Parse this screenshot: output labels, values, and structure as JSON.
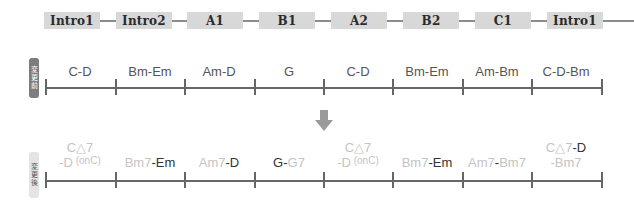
{
  "sections": [
    {
      "label": "Intro1",
      "x": 44
    },
    {
      "label": "Intro2",
      "x": 116
    },
    {
      "label": "A1",
      "x": 187
    },
    {
      "label": "B1",
      "x": 259
    },
    {
      "label": "A2",
      "x": 331
    },
    {
      "label": "B2",
      "x": 403
    },
    {
      "label": "C1",
      "x": 475
    },
    {
      "label": "Intro1",
      "x": 547
    }
  ],
  "before": {
    "label_chars": [
      "変",
      "更",
      "前"
    ],
    "chords": [
      "C-D",
      "Bm-Em",
      "Am-D",
      "G",
      "C-D",
      "Bm-Em",
      "Am-Bm",
      "C-D-Bm"
    ]
  },
  "after": {
    "label_chars": [
      "変",
      "更",
      "後"
    ],
    "chords": [
      {
        "line1": [
          {
            "t": "C△7",
            "c": "lt"
          }
        ],
        "line2": [
          {
            "t": "-D",
            "c": "lt"
          },
          {
            "t": " (onC)",
            "c": "lt",
            "sup": true
          }
        ]
      },
      {
        "line1": [
          {
            "t": "Bm7",
            "c": "lt"
          },
          {
            "t": "-Em",
            "c": "dk"
          }
        ]
      },
      {
        "line1": [
          {
            "t": "Am7",
            "c": "lt"
          },
          {
            "t": "-D",
            "c": "dk"
          }
        ]
      },
      {
        "line1": [
          {
            "t": "G",
            "c": "dk"
          },
          {
            "t": "-",
            "c": "dk"
          },
          {
            "t": "G7",
            "c": "lt"
          }
        ]
      },
      {
        "line1": [
          {
            "t": "C△7",
            "c": "lt"
          }
        ],
        "line2": [
          {
            "t": "-D",
            "c": "lt"
          },
          {
            "t": " (onC)",
            "c": "lt",
            "sup": true
          }
        ]
      },
      {
        "line1": [
          {
            "t": "Bm7",
            "c": "lt"
          },
          {
            "t": "-Em",
            "c": "dk"
          }
        ]
      },
      {
        "line1": [
          {
            "t": "Am7",
            "c": "lt"
          },
          {
            "t": "-",
            "c": "dk"
          },
          {
            "t": "Bm7",
            "c": "lt"
          }
        ]
      },
      {
        "line1": [
          {
            "t": "C△7",
            "c": "lt"
          },
          {
            "t": "-D",
            "c": "dk"
          }
        ],
        "line2": [
          {
            "t": "-Bm7",
            "c": "lt"
          }
        ]
      }
    ]
  },
  "ticks_x": [
    45,
    115,
    184,
    254,
    323,
    392,
    462,
    531,
    601
  ],
  "arrow_icon": "down-arrow",
  "colors": {
    "box": "#d8d8d8",
    "arrow": "#9a9a9a",
    "chord_light": "#c4c4c4",
    "chord_dark": "#333333"
  }
}
